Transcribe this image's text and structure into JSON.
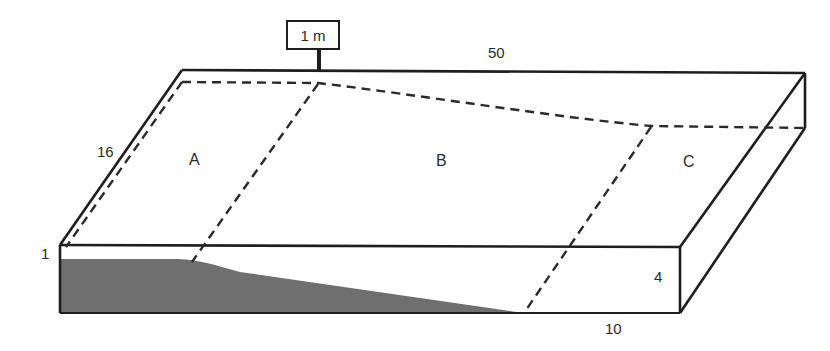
{
  "diagram": {
    "type": "block-diagram",
    "marker": {
      "label": "1 m"
    },
    "dimensions": {
      "length_top": "50",
      "width_left": "16",
      "thickness_left": "1",
      "thickness_right": "4",
      "width_front_right": "10"
    },
    "zones": [
      {
        "id": "A",
        "label": "A"
      },
      {
        "id": "B",
        "label": "B"
      },
      {
        "id": "C",
        "label": "C"
      }
    ],
    "colors": {
      "line": "#1e1e1e",
      "shading": "#6f6f6f",
      "background": "#ffffff"
    }
  }
}
